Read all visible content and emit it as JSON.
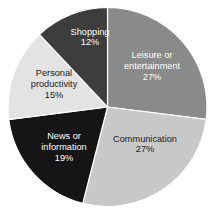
{
  "chart_data": {
    "type": "pie",
    "title": "",
    "subtitle": "",
    "xlabel": "",
    "ylabel": "",
    "legend_position": "none",
    "grid": false,
    "labels_inside_slices": true,
    "units": "percent",
    "total": 100,
    "categories": [
      "Leisure or entertainment",
      "Communication",
      "News or information",
      "Personal productivity",
      "Shopping"
    ],
    "values": [
      27,
      27,
      19,
      15,
      12
    ],
    "colors": [
      "#8a8a8a",
      "#c8c8c8",
      "#151515",
      "#e3e3e3",
      "#3d3d3d"
    ],
    "slices": [
      {
        "name": "leisure-or-entertainment",
        "label_line1": "Leisure or",
        "label_line2": "entertainment",
        "value_label": "27%",
        "value": 27,
        "color": "#8a8a8a",
        "text_color": "#ffffff",
        "start_angle": 0,
        "end_angle": 97.2,
        "label_x": 152,
        "label_y": 67
      },
      {
        "name": "communication",
        "label_line1": "Communication",
        "label_line2": "",
        "value_label": "27%",
        "value": 27,
        "color": "#c8c8c8",
        "text_color": "#1a1a1a",
        "start_angle": 97.2,
        "end_angle": 194.4,
        "label_x": 145,
        "label_y": 145
      },
      {
        "name": "news-or-information",
        "label_line1": "News or",
        "label_line2": "information",
        "value_label": "19%",
        "value": 19,
        "color": "#151515",
        "text_color": "#ffffff",
        "start_angle": 194.4,
        "end_angle": 262.8,
        "label_x": 64,
        "label_y": 148
      },
      {
        "name": "personal-productivity",
        "label_line1": "Personal",
        "label_line2": "productivity",
        "value_label": "15%",
        "value": 15,
        "color": "#e3e3e3",
        "text_color": "#1a1a1a",
        "start_angle": 262.8,
        "end_angle": 316.8,
        "label_x": 54,
        "label_y": 85
      },
      {
        "name": "shopping",
        "label_line1": "Shopping",
        "label_line2": "",
        "value_label": "12%",
        "value": 12,
        "color": "#3d3d3d",
        "text_color": "#ffffff",
        "start_angle": 316.8,
        "end_angle": 360,
        "label_x": 90,
        "label_y": 38
      }
    ],
    "geometry": {
      "center_x": 107.5,
      "center_y": 107,
      "radius": 99.5
    },
    "background_color": "#ffffff"
  }
}
